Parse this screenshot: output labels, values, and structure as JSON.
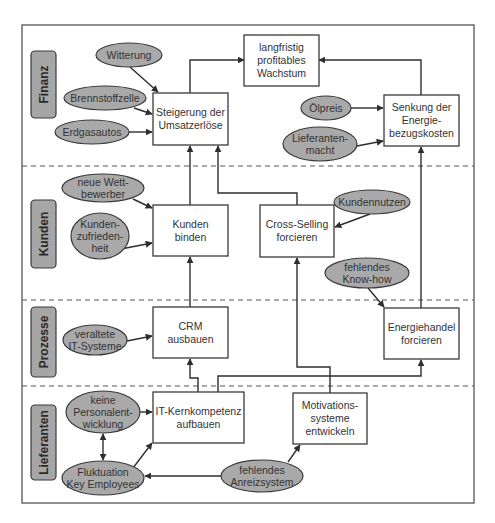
{
  "lanes": [
    {
      "id": "finanz",
      "label": "Finanz"
    },
    {
      "id": "kunden",
      "label": "Kunden"
    },
    {
      "id": "prozesse",
      "label": "Prozesse"
    },
    {
      "id": "lieferanten",
      "label": "Lieferanten"
    }
  ],
  "objectives": {
    "umsatz": {
      "lines": [
        "Steigerung der",
        "Umsatzerlöse"
      ],
      "lane": "finanz"
    },
    "wachstum": {
      "lines": [
        "langfristig",
        "profitables",
        "Wachstum"
      ],
      "lane": "finanz"
    },
    "energiekosten": {
      "lines": [
        "Senkung der",
        "Energie-",
        "bezugskosten"
      ],
      "lane": "finanz"
    },
    "kundenbinden": {
      "lines": [
        "Kunden",
        "binden"
      ],
      "lane": "kunden"
    },
    "crossselling": {
      "lines": [
        "Cross-Selling",
        "forcieren"
      ],
      "lane": "kunden"
    },
    "crm": {
      "lines": [
        "CRM",
        "ausbauen"
      ],
      "lane": "prozesse"
    },
    "energiehandel": {
      "lines": [
        "Energiehandel",
        "forcieren"
      ],
      "lane": "prozesse"
    },
    "itkern": {
      "lines": [
        "IT-Kernkompetenz",
        "aufbauen"
      ],
      "lane": "lieferanten"
    },
    "motivation": {
      "lines": [
        "Motivations-",
        "systeme",
        "entwickeln"
      ],
      "lane": "lieferanten"
    }
  },
  "factors": {
    "witterung": {
      "lines": [
        "Witterung"
      ]
    },
    "brennstoffzelle": {
      "lines": [
        "Brennstoffzelle"
      ]
    },
    "erdgasautos": {
      "lines": [
        "Erdgasautos"
      ]
    },
    "oelpreis": {
      "lines": [
        "Ölpreis"
      ]
    },
    "lieferantenmacht": {
      "lines": [
        "Lieferanten-",
        "macht"
      ]
    },
    "wettbewerber": {
      "lines": [
        "neue Wett-",
        "bewerber"
      ]
    },
    "zufriedenheit": {
      "lines": [
        "Kunden-",
        "zufrieden-",
        "heit"
      ]
    },
    "kundennutzen": {
      "lines": [
        "Kundennutzen"
      ]
    },
    "knowhow": {
      "lines": [
        "fehlendes",
        "Know-how"
      ]
    },
    "itsysteme": {
      "lines": [
        "veraltete",
        "IT-Systeme"
      ]
    },
    "personal": {
      "lines": [
        "keine",
        "Personalent-",
        "wicklung"
      ]
    },
    "fluktuation": {
      "lines": [
        "Fluktuation",
        "Key Employees"
      ]
    },
    "anreiz": {
      "lines": [
        "fehlendes",
        "Anreizsystem"
      ]
    }
  },
  "edges": [
    {
      "from": "umsatz",
      "to": "wachstum"
    },
    {
      "from": "energiekosten",
      "to": "wachstum"
    },
    {
      "from": "witterung",
      "to": "umsatz"
    },
    {
      "from": "brennstoffzelle",
      "to": "umsatz"
    },
    {
      "from": "erdgasautos",
      "to": "umsatz"
    },
    {
      "from": "oelpreis",
      "to": "energiekosten"
    },
    {
      "from": "lieferantenmacht",
      "to": "energiekosten"
    },
    {
      "from": "kundenbinden",
      "to": "umsatz"
    },
    {
      "from": "crossselling",
      "to": "umsatz"
    },
    {
      "from": "wettbewerber",
      "to": "kundenbinden"
    },
    {
      "from": "zufriedenheit",
      "to": "kundenbinden"
    },
    {
      "from": "kundennutzen",
      "to": "crossselling"
    },
    {
      "from": "knowhow",
      "to": "energiehandel"
    },
    {
      "from": "energiehandel",
      "to": "energiekosten"
    },
    {
      "from": "crm",
      "to": "kundenbinden"
    },
    {
      "from": "itsysteme",
      "to": "crm"
    },
    {
      "from": "itkern",
      "to": "crm"
    },
    {
      "from": "itkern",
      "to": "energiehandel"
    },
    {
      "from": "motivation",
      "to": "crossselling"
    },
    {
      "from": "personal",
      "to": "itkern"
    },
    {
      "from": "personal",
      "to": "fluktuation",
      "bidirectional": true
    },
    {
      "from": "fluktuation",
      "to": "itkern"
    },
    {
      "from": "anreiz",
      "to": "fluktuation"
    },
    {
      "from": "anreiz",
      "to": "motivation"
    }
  ]
}
